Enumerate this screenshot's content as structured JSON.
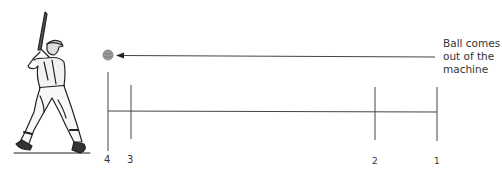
{
  "diagram": {
    "annotation": {
      "lines": [
        "Ball comes",
        "out of the",
        "machine"
      ]
    },
    "markers": [
      {
        "id": "4",
        "label": "4",
        "x": 108
      },
      {
        "id": "3",
        "label": "3",
        "x": 131
      },
      {
        "id": "2",
        "label": "2",
        "x": 375
      },
      {
        "id": "1",
        "label": "1",
        "x": 437
      }
    ],
    "figures": {
      "batter": "baseball-batter-illustration",
      "ball": "baseball"
    },
    "colors": {
      "line": "#444444",
      "text": "#333333",
      "ball": "#9a9a9a"
    }
  }
}
